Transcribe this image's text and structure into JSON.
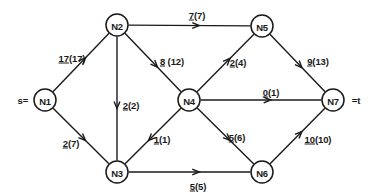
{
  "diagram": {
    "type": "network-flow-graph",
    "source_marker": "s=",
    "sink_marker": "=t",
    "stroke_color": "#1a1a1a",
    "background_color": "#ffffff",
    "nodes": [
      {
        "id": "N1",
        "label": "N1",
        "x": 45,
        "y": 100,
        "r": 11,
        "role": "source"
      },
      {
        "id": "N2",
        "label": "N2",
        "x": 117,
        "y": 25,
        "r": 11,
        "role": "intermediate"
      },
      {
        "id": "N3",
        "label": "N3",
        "x": 117,
        "y": 172,
        "r": 11,
        "role": "intermediate"
      },
      {
        "id": "N4",
        "label": "N4",
        "x": 189,
        "y": 100,
        "r": 11,
        "role": "intermediate"
      },
      {
        "id": "N5",
        "label": "N5",
        "x": 262,
        "y": 26,
        "r": 11,
        "role": "intermediate"
      },
      {
        "id": "N6",
        "label": "N6",
        "x": 262,
        "y": 172,
        "r": 11,
        "role": "intermediate"
      },
      {
        "id": "N7",
        "label": "N7",
        "x": 333,
        "y": 100,
        "r": 11,
        "role": "sink"
      }
    ],
    "edges": [
      {
        "id": "e-n1-n2",
        "from": "N1",
        "to": "N2",
        "flow": "17",
        "capacity": "(17)",
        "label": "17(17)",
        "label_x": 72,
        "label_y": 58
      },
      {
        "id": "e-n1-n3",
        "from": "N1",
        "to": "N3",
        "flow": "2",
        "capacity": "(7)",
        "label": "2(7)",
        "label_x": 71,
        "label_y": 143
      },
      {
        "id": "e-n2-n5",
        "from": "N2",
        "to": "N5",
        "flow": "7",
        "capacity": "(7)",
        "label": "7(7)",
        "label_x": 197,
        "label_y": 15
      },
      {
        "id": "e-n2-n4",
        "from": "N2",
        "to": "N4",
        "flow": "8",
        "capacity": " (12)",
        "label": "8 (12)",
        "label_x": 172,
        "label_y": 61
      },
      {
        "id": "e-n2-n3",
        "from": "N2",
        "to": "N3",
        "flow": "2",
        "capacity": "(2)",
        "label": "2(2)",
        "label_x": 131,
        "label_y": 105
      },
      {
        "id": "e-n4-n5",
        "from": "N4",
        "to": "N5",
        "flow": "2",
        "capacity": "(4)",
        "label": "2(4)",
        "label_x": 238,
        "label_y": 62
      },
      {
        "id": "e-n4-n7",
        "from": "N4",
        "to": "N7",
        "flow": "0",
        "capacity": "(1)",
        "label": "0(1)",
        "label_x": 271,
        "label_y": 92
      },
      {
        "id": "e-n4-n3",
        "from": "N4",
        "to": "N3",
        "flow": "1",
        "capacity": "(1)",
        "label": "1(1)",
        "label_x": 162,
        "label_y": 139
      },
      {
        "id": "e-n4-n6",
        "from": "N4",
        "to": "N6",
        "flow": "5",
        "capacity": "(6)",
        "label": "5(6)",
        "label_x": 237,
        "label_y": 137
      },
      {
        "id": "e-n5-n7",
        "from": "N5",
        "to": "N7",
        "flow": "9",
        "capacity": "(13)",
        "label": "9(13)",
        "label_x": 318,
        "label_y": 61
      },
      {
        "id": "e-n3-n6",
        "from": "N3",
        "to": "N6",
        "flow": "5",
        "capacity": "(5)",
        "label": "5(5)",
        "label_x": 198,
        "label_y": 186
      },
      {
        "id": "e-n6-n7",
        "from": "N6",
        "to": "N7",
        "flow": "10",
        "capacity": "(10)",
        "label": "10(10)",
        "label_x": 318,
        "label_y": 139
      }
    ],
    "terminals": [
      {
        "id": "source-text",
        "text": "s=",
        "x": 23,
        "y": 100
      },
      {
        "id": "sink-text",
        "text": "=t",
        "x": 356,
        "y": 100
      }
    ]
  }
}
